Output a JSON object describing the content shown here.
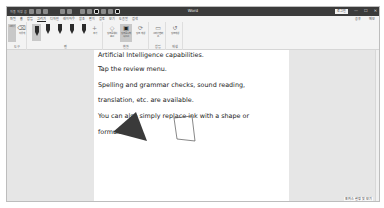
{
  "window": {
    "title": "Word",
    "account_badge": "로그인",
    "quick_access": [
      "자동 저장 끔",
      "저장",
      "실행 취소",
      "다시 실행",
      "그리기 도구",
      "펜"
    ]
  },
  "window_controls": {
    "minimize": "—",
    "maximize": "☐",
    "close": "✕"
  },
  "tabs": [
    {
      "label": "파일"
    },
    {
      "label": "홈"
    },
    {
      "label": "삽입"
    },
    {
      "label": "그리기",
      "active": true
    },
    {
      "label": "디자인"
    },
    {
      "label": "레이아웃"
    },
    {
      "label": "참조"
    },
    {
      "label": "편지"
    },
    {
      "label": "검토"
    },
    {
      "label": "보기"
    },
    {
      "label": "도움말"
    },
    {
      "label": "검색"
    }
  ],
  "tab_right": {
    "share": "공유",
    "comments": "메모"
  },
  "ribbon": {
    "groups": [
      {
        "label": "도구",
        "tools": [
          {
            "label": "그리기"
          },
          {
            "label": "지우개"
          }
        ]
      },
      {
        "label": "펜",
        "tools": [
          {
            "label": "펜 1"
          },
          {
            "label": "펜 2"
          },
          {
            "label": "펜 3"
          },
          {
            "label": "형광펜"
          },
          {
            "label": "연필"
          },
          {
            "label": "추가"
          }
        ]
      },
      {
        "label": "변환",
        "tools": [
          {
            "label": "잉크를 셰이프로"
          },
          {
            "label": "잉크를 수학 식으로"
          },
          {
            "label": "잉크 재생"
          }
        ]
      },
      {
        "label": "삽입",
        "tools": [
          {
            "label": "그리기 캔버스"
          }
        ]
      },
      {
        "label": "재생",
        "tools": [
          {
            "label": "잉크 재생"
          }
        ]
      }
    ]
  },
  "document": {
    "lines": [
      "Artificial Intelligence capabilities.",
      "Tap the review menu.",
      "Spelling and grammar checks, sound reading,",
      "translation, etc. are available.",
      "You can also simply replace ink with a shape or",
      "formula."
    ],
    "shapes": [
      {
        "type": "filled-triangle",
        "color": "#3a3a3a"
      },
      {
        "type": "hand-drawn-rectangle",
        "color": "#555555"
      }
    ]
  },
  "status": {
    "text": "포커스 설정 및 보기"
  }
}
